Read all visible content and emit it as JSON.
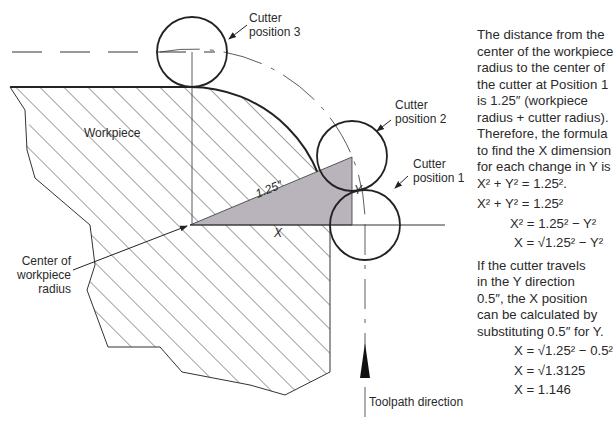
{
  "diagram": {
    "labels": {
      "cutter_position_3": [
        "Cutter",
        "position 3"
      ],
      "cutter_position_2": [
        "Cutter",
        "position 2"
      ],
      "cutter_position_1": [
        "Cutter",
        "position 1"
      ],
      "workpiece": "Workpiece",
      "center_of_workpiece_radius": [
        "Center of",
        "workpiece",
        "radius"
      ],
      "hypotenuse": "1.25″",
      "x_leg": "X",
      "y_leg": "Y",
      "toolpath_direction": "Toolpath direction"
    },
    "colors": {
      "line": "#222222",
      "triangle_fill": "#b9b4bb",
      "hatch": "#444444"
    }
  },
  "explanation": {
    "intro_lines": [
      "The distance from the",
      "center of the workpiece",
      "radius to the center of",
      "the cutter at Position 1",
      "is 1.25″ (workpiece",
      "radius + cutter radius).",
      "Therefore, the formula",
      "to find the X dimension",
      "for each change in Y is"
    ],
    "equations_1": [
      "X² + Y² = 1.25².",
      "X² + Y² = 1.25²",
      "X² = 1.25² − Y²",
      "X = √1.25² − Y²"
    ],
    "paragraph_2_lines": [
      "If the cutter travels",
      "in the Y direction",
      "0.5″, the X position",
      "can be calculated by",
      "substituting 0.5″ for Y."
    ],
    "equations_2": [
      "X = √1.25² − 0.5²",
      "X = √1.3125",
      "X = 1.146"
    ]
  }
}
